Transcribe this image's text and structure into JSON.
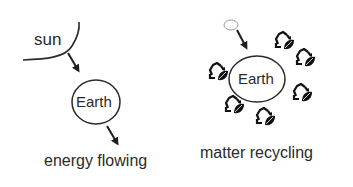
{
  "left_panel": {
    "sun_label": "sun",
    "earth_label": "Earth",
    "caption": "energy flowing"
  },
  "right_panel": {
    "earth_label": "Earth",
    "caption": "matter recycling",
    "recycle_icon_count": 7
  },
  "colors": {
    "stroke": "#2a2a2a",
    "background": "#ffffff",
    "small_ellipse": "#9a9a9a"
  }
}
